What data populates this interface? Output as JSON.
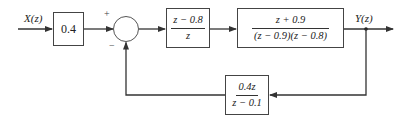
{
  "diagram": {
    "type": "block-diagram",
    "input_label": "X(z)",
    "output_label": "Y(z)",
    "summing_junction": {
      "plus_sign": "+",
      "minus_sign": "−"
    },
    "blocks": {
      "gain": {
        "value": "0.4"
      },
      "controller": {
        "numerator": "z − 0.8",
        "denominator": "z"
      },
      "plant": {
        "numerator": "z + 0.9",
        "denominator": "(z − 0.9)(z − 0.8)"
      },
      "feedback": {
        "numerator": "0.4z",
        "denominator": "z − 0.1"
      }
    },
    "colors": {
      "line": "#333333",
      "background": "#ffffff"
    }
  }
}
